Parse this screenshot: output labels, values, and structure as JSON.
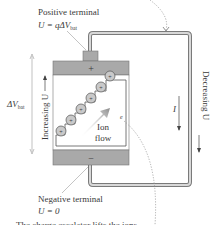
{
  "diagram": {
    "positive_terminal": {
      "label": "Positive terminal",
      "equation_prefix": "U = qΔV",
      "equation_sub": "bat"
    },
    "negative_terminal": {
      "label": "Negative terminal",
      "equation": "U = 0"
    },
    "battery": {
      "plus_sign": "+",
      "minus_sign": "−",
      "ion_charge": "+"
    },
    "delta_v": {
      "prefix": "ΔV",
      "sub": "bat"
    },
    "increasing_label": "Increasing U",
    "decreasing_label": "Decreasing U",
    "current_label": "I",
    "ion_flow_line1": "Ion",
    "ion_flow_line2": "flow",
    "electron_label": "e",
    "caption_partial": "The charge escalator lifts the ions...",
    "colors": {
      "battery_gray": "#a9a9a9",
      "wire": "#8a8a8a",
      "arrow_fill": "#9a9a9a",
      "text": "#3a3a3a"
    }
  }
}
